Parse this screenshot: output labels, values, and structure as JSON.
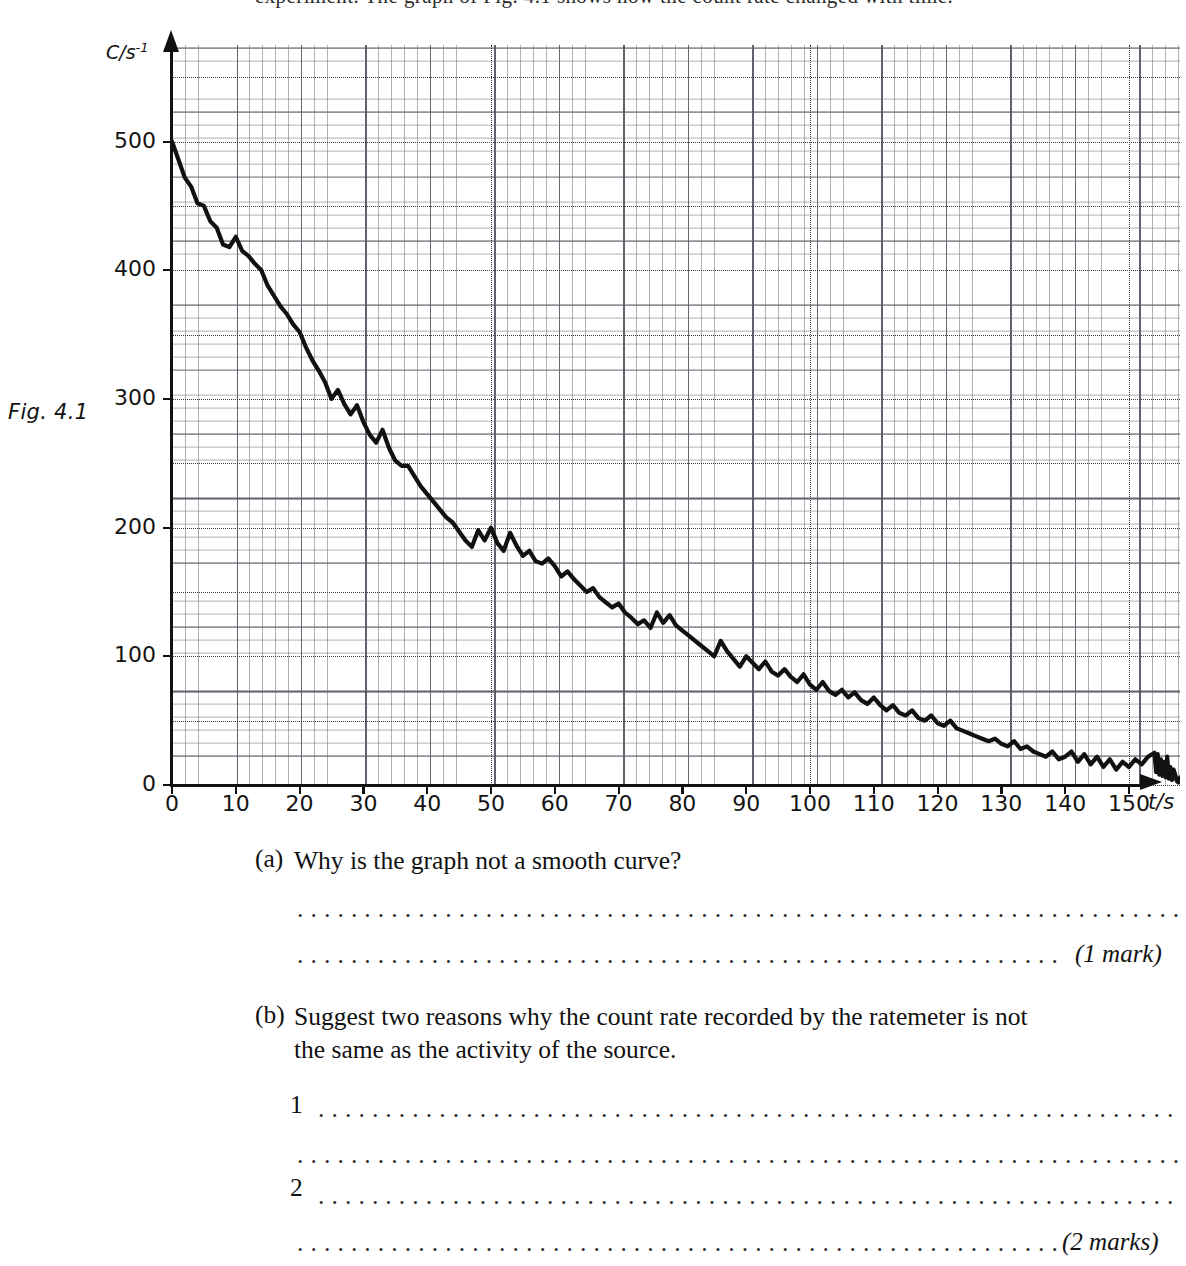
{
  "page": {
    "figure_label": "Fig. 4.1",
    "top_clipped_text": "experiment. The graph of Fig. 4.1 shows how the count rate changed with time."
  },
  "chart_data": {
    "type": "line",
    "title": "",
    "xlabel": "t/s",
    "ylabel": "C/s",
    "ylabel_exponent": "-1",
    "xlim": [
      0,
      158
    ],
    "ylim": [
      0,
      575
    ],
    "x_ticks": [
      0,
      10,
      20,
      30,
      40,
      50,
      60,
      70,
      80,
      90,
      100,
      110,
      120,
      130,
      140,
      150
    ],
    "y_ticks": [
      0,
      100,
      200,
      300,
      400,
      500
    ],
    "grid": "graph-paper; fine 2 s / 10 c-s-1, medium 10 s / 50 c-s-1, dotted major 50 s / 50 c-s-1",
    "legend": "none",
    "annotation": "Noisy exponential decay of count rate; half-life approx 35 s",
    "x": [
      0,
      1,
      2,
      3,
      4,
      5,
      6,
      7,
      8,
      9,
      10,
      11,
      12,
      13,
      14,
      15,
      16,
      17,
      18,
      19,
      20,
      21,
      22,
      23,
      24,
      25,
      26,
      27,
      28,
      29,
      30,
      31,
      32,
      33,
      34,
      35,
      36,
      37,
      38,
      39,
      40,
      41,
      42,
      43,
      44,
      45,
      46,
      47,
      48,
      49,
      50,
      51,
      52,
      53,
      54,
      55,
      56,
      57,
      58,
      59,
      60,
      61,
      62,
      63,
      64,
      65,
      66,
      67,
      68,
      69,
      70,
      71,
      72,
      73,
      74,
      75,
      76,
      77,
      78,
      79,
      80,
      81,
      82,
      83,
      84,
      85,
      86,
      87,
      88,
      89,
      90,
      91,
      92,
      93,
      94,
      95,
      96,
      97,
      98,
      99,
      100,
      101,
      102,
      103,
      104,
      105,
      106,
      107,
      108,
      109,
      110,
      111,
      112,
      113,
      114,
      115,
      116,
      117,
      118,
      119,
      120,
      121,
      122,
      123,
      124,
      125,
      126,
      127,
      128,
      129,
      130,
      131,
      132,
      133,
      134,
      135,
      136,
      137,
      138,
      139,
      140,
      141,
      142,
      143,
      144,
      145,
      146,
      147,
      148,
      149,
      150,
      151,
      152,
      153
    ],
    "y": [
      500,
      486,
      472,
      465,
      452,
      450,
      438,
      433,
      420,
      418,
      426,
      415,
      411,
      405,
      400,
      388,
      380,
      372,
      366,
      358,
      352,
      340,
      330,
      322,
      313,
      300,
      307,
      296,
      288,
      295,
      282,
      272,
      266,
      276,
      262,
      252,
      248,
      248,
      240,
      232,
      226,
      220,
      214,
      208,
      204,
      197,
      190,
      185,
      198,
      190,
      200,
      188,
      182,
      196,
      186,
      178,
      182,
      174,
      172,
      176,
      170,
      162,
      166,
      160,
      155,
      150,
      153,
      146,
      142,
      138,
      141,
      134,
      130,
      125,
      128,
      122,
      134,
      126,
      132,
      124,
      120,
      116,
      112,
      108,
      104,
      100,
      112,
      104,
      98,
      92,
      100,
      95,
      90,
      96,
      88,
      85,
      90,
      84,
      80,
      86,
      78,
      74,
      80,
      73,
      70,
      74,
      68,
      72,
      66,
      63,
      68,
      62,
      58,
      62,
      56,
      54,
      58,
      52,
      50,
      54,
      48,
      46,
      50,
      44,
      42,
      40,
      38,
      36,
      34,
      36,
      32,
      30,
      34,
      28,
      30,
      26,
      24,
      22,
      26,
      20,
      22,
      26,
      18,
      24,
      16,
      22,
      14,
      20,
      12,
      18,
      14,
      20,
      16,
      22
    ],
    "y_noisy_tail": [
      25,
      10,
      24,
      8,
      20,
      7,
      18,
      6,
      22,
      5,
      14,
      4,
      12,
      8,
      3,
      2,
      6,
      4,
      4,
      4
    ]
  },
  "questions": [
    {
      "marker": "(a)",
      "text": "Why is the graph not a smooth curve?",
      "text_line2": "",
      "marks": "(1 mark)"
    },
    {
      "marker": "(b)",
      "text": "Suggest two reasons why the count rate recorded by the ratemeter is not",
      "text_line2": "the same as the activity of the source.",
      "answer_numbers": [
        "1",
        "2"
      ],
      "marks": "(2 marks)"
    }
  ],
  "dots": {
    "long": "..........................................................................",
    "short": "................................................................."
  },
  "colors": {
    "ink": "#111111",
    "grid_fine": "#6e6e78",
    "grid_medium": "#46464f",
    "grid_major": "#3c3c46",
    "paper": "#ffffff"
  }
}
